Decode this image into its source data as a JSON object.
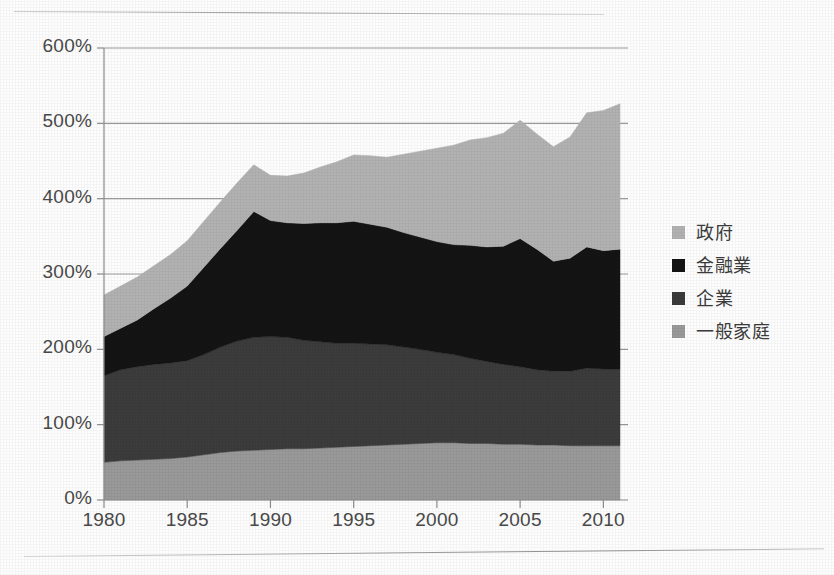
{
  "chart_data": {
    "type": "area",
    "stacked": true,
    "title": "",
    "subtitle": "",
    "xlabel": "",
    "ylabel": "",
    "xlim": [
      1980,
      2011
    ],
    "ylim": [
      0,
      600
    ],
    "ytick_values": [
      0,
      100,
      200,
      300,
      400,
      500,
      600
    ],
    "ytick_labels": [
      "0%",
      "100%",
      "200%",
      "300%",
      "400%",
      "500%",
      "600%"
    ],
    "xtick_values": [
      1980,
      1985,
      1990,
      1995,
      2000,
      2005,
      2010
    ],
    "xtick_labels": [
      "1980",
      "1985",
      "1990",
      "1995",
      "2000",
      "2005",
      "2010"
    ],
    "grid": "horizontal",
    "legend_position": "right",
    "value_unit": "percent",
    "x": [
      1980,
      1981,
      1982,
      1983,
      1984,
      1985,
      1986,
      1987,
      1988,
      1989,
      1990,
      1991,
      1992,
      1993,
      1994,
      1995,
      1996,
      1997,
      1998,
      1999,
      2000,
      2001,
      2002,
      2003,
      2004,
      2005,
      2006,
      2007,
      2008,
      2009,
      2010,
      2011
    ],
    "series": [
      {
        "name": "一般家庭",
        "color": "#9a9a9a",
        "stack_order": 1,
        "values": [
          50,
          52,
          53,
          54,
          55,
          57,
          60,
          63,
          65,
          66,
          67,
          68,
          68,
          69,
          70,
          71,
          72,
          73,
          74,
          75,
          76,
          76,
          75,
          75,
          74,
          74,
          73,
          73,
          72,
          72,
          72,
          72
        ]
      },
      {
        "name": "企業",
        "color": "#3c3c3c",
        "stack_order": 2,
        "values": [
          115,
          121,
          124,
          126,
          127,
          128,
          133,
          140,
          146,
          150,
          150,
          148,
          144,
          141,
          138,
          137,
          135,
          133,
          129,
          125,
          120,
          117,
          113,
          109,
          106,
          103,
          100,
          98,
          99,
          103,
          102,
          102
        ]
      },
      {
        "name": "金融業",
        "color": "#141414",
        "stack_order": 3,
        "values": [
          52,
          55,
          62,
          74,
          86,
          99,
          116,
          131,
          147,
          167,
          154,
          152,
          155,
          158,
          160,
          162,
          159,
          156,
          152,
          149,
          147,
          146,
          150,
          152,
          157,
          170,
          160,
          146,
          150,
          161,
          157,
          159
        ]
      },
      {
        "name": "政府",
        "color": "#b2b2b2",
        "stack_order": 4,
        "values": [
          55,
          56,
          57,
          57,
          58,
          60,
          61,
          62,
          63,
          62,
          60,
          62,
          67,
          74,
          81,
          88,
          91,
          93,
          104,
          114,
          124,
          132,
          140,
          145,
          150,
          157,
          153,
          152,
          161,
          178,
          186,
          193
        ]
      }
    ],
    "totals": [
      272,
      284,
      296,
      311,
      326,
      344,
      370,
      396,
      421,
      445,
      431,
      430,
      434,
      442,
      449,
      458,
      457,
      455,
      459,
      463,
      467,
      471,
      478,
      481,
      487,
      504,
      486,
      469,
      482,
      514,
      517,
      526
    ]
  },
  "yaxis": {
    "ticks": [
      {
        "label": "600%",
        "value": 600
      },
      {
        "label": "500%",
        "value": 500
      },
      {
        "label": "400%",
        "value": 400
      },
      {
        "label": "300%",
        "value": 300
      },
      {
        "label": "200%",
        "value": 200
      },
      {
        "label": "100%",
        "value": 100
      },
      {
        "label": "0%",
        "value": 0
      }
    ]
  },
  "xaxis": {
    "ticks": [
      {
        "label": "1980",
        "value": 1980
      },
      {
        "label": "1985",
        "value": 1985
      },
      {
        "label": "1990",
        "value": 1990
      },
      {
        "label": "1995",
        "value": 1995
      },
      {
        "label": "2000",
        "value": 2000
      },
      {
        "label": "2005",
        "value": 2005
      },
      {
        "label": "2010",
        "value": 2010
      }
    ]
  },
  "legend": {
    "items": [
      {
        "label": "政府",
        "color": "#b2b2b2",
        "swatch_name": "legend-swatch-government"
      },
      {
        "label": "金融業",
        "color": "#141414",
        "swatch_name": "legend-swatch-financial"
      },
      {
        "label": "企業",
        "color": "#3c3c3c",
        "swatch_name": "legend-swatch-corporate"
      },
      {
        "label": "一般家庭",
        "color": "#9a9a9a",
        "swatch_name": "legend-swatch-household"
      }
    ]
  },
  "style": {
    "axis_color": "#8e8e8e",
    "grid_color": "#9b9b9b",
    "text_color": "#4a4a4a",
    "background": "#fefefe",
    "rule_color": "#9e9e9e"
  },
  "geometry": {
    "plot_left": 104,
    "plot_right": 620,
    "plot_top": 48,
    "plot_bottom": 500
  }
}
